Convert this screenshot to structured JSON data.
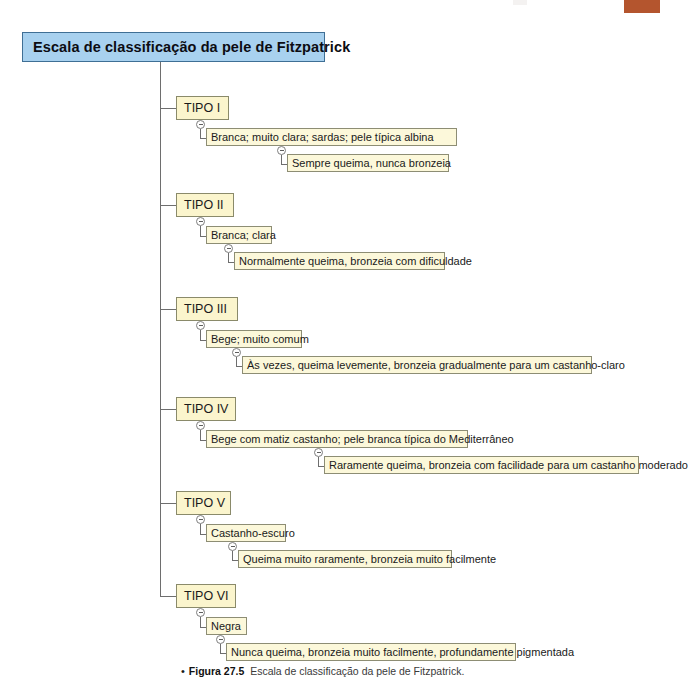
{
  "figure": {
    "title": "Escala de classificação da pele de Fitzpatrick",
    "caption_bullet": "•",
    "caption_figure_label": "Figura 27.5",
    "caption_text": "Escala de classificação da pele de Fitzpatrick."
  },
  "colors": {
    "title_fill": "#a8d1ef",
    "title_border": "#3f6f95",
    "node_fill": "#fbf6d0",
    "node_border": "#7a7a62",
    "line": "#6e6e6e",
    "artifact_block": "#b4552e"
  },
  "tree": {
    "root_label": "Escala de classificação da pele de Fitzpatrick",
    "branches": [
      {
        "type_label": "TIPO I",
        "description": "Branca; muito clara; sardas; pele típica albina",
        "effect": "Sempre queima, nunca bronzeia"
      },
      {
        "type_label": "TIPO II",
        "description": "Branca; clara",
        "effect": "Normalmente queima, bronzeia com dificuldade"
      },
      {
        "type_label": "TIPO III",
        "description": "Bege; muito comum",
        "effect": "Às vezes, queima levemente, bronzeia gradualmente para um castanho-claro"
      },
      {
        "type_label": "TIPO IV",
        "description": "Bege com matiz castanho; pele branca típica do Mediterrâneo",
        "effect": "Raramente queima, bronzeia com facilidade para um castanho moderado"
      },
      {
        "type_label": "TIPO V",
        "description": "Castanho-escuro",
        "effect": "Queima muito raramente, bronzeia muito facilmente"
      },
      {
        "type_label": "TIPO VI",
        "description": "Negra",
        "effect": "Nunca queima, bronzeia muito facilmente, profundamente pigmentada"
      }
    ]
  },
  "toggles": {
    "icon": "collapse-minus-icon",
    "state": "expanded"
  }
}
